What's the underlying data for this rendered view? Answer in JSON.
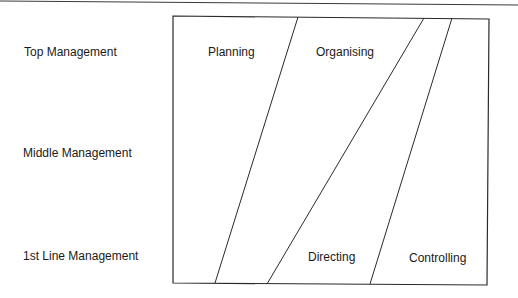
{
  "diagram": {
    "levels": [
      {
        "label": "Top Management"
      },
      {
        "label": "Middle Management"
      },
      {
        "label": "1st Line Management"
      }
    ],
    "functions": [
      {
        "label": "Planning"
      },
      {
        "label": "Organising"
      },
      {
        "label": "Directing"
      },
      {
        "label": "Controlling"
      }
    ],
    "colors": {
      "line": "#2a2a2a",
      "text": "#1a1a1a",
      "background": "#ffffff"
    }
  }
}
